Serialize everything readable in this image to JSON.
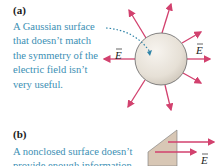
{
  "panels": [
    {
      "label": "(a)",
      "caption_lines": [
        "A Gaussian surface",
        "that doesn’t match",
        "the symmetry of the",
        "electric field isn’t",
        "very useful."
      ],
      "field_label_left": "E",
      "field_label_right": "E",
      "surface": "sphere"
    },
    {
      "label": "(b)",
      "caption_lines": [
        "A nonclosed surface doesn’t",
        "provide enough information"
      ],
      "field_label": "E",
      "surface": "open-plane"
    }
  ],
  "colors": {
    "arrow": "#d2416e",
    "caption": "#3b8fb4",
    "sphere": "#e9e4dc",
    "sphere_edge": "#555555",
    "plane": "#d8c7b5",
    "dotted": "#2f84a8"
  }
}
